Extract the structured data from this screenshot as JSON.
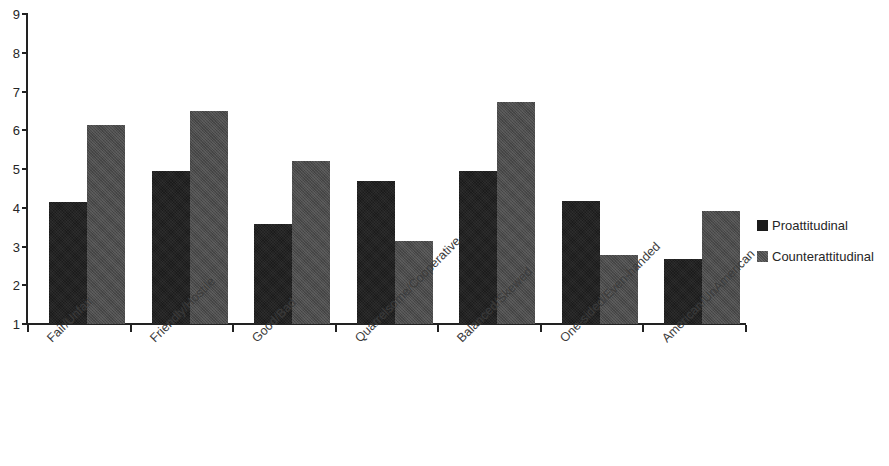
{
  "chart_data": {
    "type": "bar",
    "title": "",
    "subtitle": "",
    "xlabel": "",
    "ylabel": "",
    "ylim": [
      1,
      9
    ],
    "yticks": [
      1,
      2,
      3,
      4,
      5,
      6,
      7,
      8,
      9
    ],
    "ytick_labels": [
      "1",
      "2",
      "3",
      "4",
      "5",
      "6",
      "7",
      "8",
      "9"
    ],
    "grid": false,
    "legend_position": "right",
    "categories": [
      "Fair/Unfair",
      "Friendly/Hostile",
      "Good/Bad",
      "Quarrelsome/Cooperative",
      "Balanced/Skewed",
      "One-sided/Even-handed",
      "American/UnAmerican"
    ],
    "series": [
      {
        "name": "Proattitudinal",
        "color": "#1b1b1b",
        "values": [
          4.15,
          4.95,
          3.57,
          4.68,
          4.95,
          4.17,
          2.67
        ]
      },
      {
        "name": "Counterattitudinal",
        "color": "#4b4b4b",
        "values": [
          6.13,
          6.5,
          5.2,
          3.13,
          6.72,
          2.78,
          3.91
        ]
      }
    ]
  },
  "legend": {
    "items": [
      {
        "label": "Proattitudinal",
        "swatch": "proatt"
      },
      {
        "label": "Counterattitudinal",
        "swatch": "counteratt"
      }
    ]
  }
}
